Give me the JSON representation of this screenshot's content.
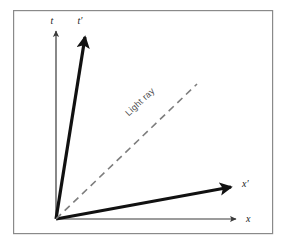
{
  "figure": {
    "kind": "spacetime-diagram",
    "background_color": "#ffffff",
    "frame": {
      "stroke_color": "#8a8a8a",
      "stroke_width": 1.2,
      "x": 13,
      "y": 10,
      "width": 260,
      "height": 224
    },
    "origin": {
      "x": 56,
      "y": 219
    }
  },
  "axes": [
    {
      "id": "t-axis",
      "label": "t",
      "style": "thin",
      "stroke_color": "#3a3a3a",
      "stroke_width": 1.2,
      "from": {
        "x": 56,
        "y": 219
      },
      "to": {
        "x": 56,
        "y": 31
      },
      "label_pos": {
        "x": 52,
        "y": 24
      }
    },
    {
      "id": "t-prime-axis",
      "label": "t′",
      "style": "thick",
      "stroke_color": "#111111",
      "stroke_width": 3.2,
      "from": {
        "x": 56,
        "y": 219
      },
      "to": {
        "x": 85,
        "y": 37
      },
      "label_pos": {
        "x": 80,
        "y": 24
      }
    },
    {
      "id": "x-axis",
      "label": "x",
      "style": "thin",
      "stroke_color": "#3a3a3a",
      "stroke_width": 1.2,
      "from": {
        "x": 56,
        "y": 219
      },
      "to": {
        "x": 236,
        "y": 219
      },
      "label_pos": {
        "x": 246,
        "y": 221
      }
    },
    {
      "id": "x-prime-axis",
      "label": "x′",
      "style": "thick",
      "stroke_color": "#111111",
      "stroke_width": 3.2,
      "from": {
        "x": 56,
        "y": 219
      },
      "to": {
        "x": 231,
        "y": 187
      },
      "label_pos": {
        "x": 242,
        "y": 186
      }
    }
  ],
  "light_ray": {
    "label": "Light ray",
    "style": "dashed",
    "stroke_color": "#7d7d7d",
    "stroke_width": 1.6,
    "dash_pattern": "7 5",
    "from": {
      "x": 56,
      "y": 219
    },
    "to": {
      "x": 197,
      "y": 84
    },
    "label_pos": {
      "x": 142,
      "y": 104
    },
    "label_rotation_deg": -43
  }
}
